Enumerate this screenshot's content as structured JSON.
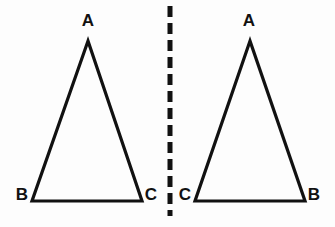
{
  "figure": {
    "canvas": {
      "width": 335,
      "height": 227
    },
    "background_color": "#fdfdfd",
    "stroke_color": "#111111",
    "label_color": "#111111",
    "stroke_width": 3.2
  },
  "left_triangle": {
    "name": "triangle-ABC-left",
    "points": "88,41 32,201 142,201",
    "vertices": [
      {
        "label": "A",
        "role": "apex",
        "x": 88,
        "y": 41,
        "label_x": 88,
        "label_y": 26
      },
      {
        "label": "B",
        "role": "bottom-left",
        "x": 32,
        "y": 201,
        "label_x": 22,
        "label_y": 200
      },
      {
        "label": "C",
        "role": "bottom-right",
        "x": 142,
        "y": 201,
        "label_x": 151,
        "label_y": 200
      }
    ]
  },
  "mirror_line": {
    "name": "mirror-axis",
    "x": 170,
    "y_start": 6,
    "y_end": 216,
    "dash_length": 11,
    "gap_length": 6,
    "stroke_width": 5,
    "dasharray": "11 6"
  },
  "right_triangle": {
    "name": "triangle-ACB-right",
    "points": "250,41 195,201 305,201",
    "vertices": [
      {
        "label": "A",
        "role": "apex",
        "x": 250,
        "y": 41,
        "label_x": 249,
        "label_y": 26
      },
      {
        "label": "C",
        "role": "bottom-left",
        "x": 195,
        "y": 201,
        "label_x": 185,
        "label_y": 200
      },
      {
        "label": "B",
        "role": "bottom-right",
        "x": 305,
        "y": 201,
        "label_x": 314,
        "label_y": 200
      }
    ]
  }
}
